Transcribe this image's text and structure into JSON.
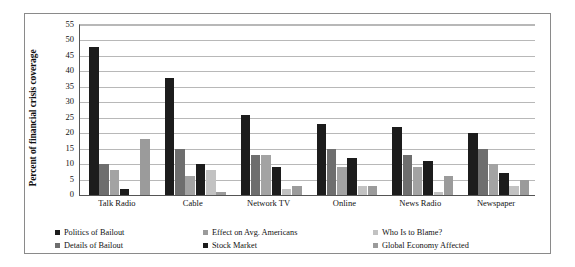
{
  "chart_data": {
    "type": "bar",
    "title": "",
    "xlabel": "",
    "ylabel": "Percent of financial crisis coverage",
    "ylim": [
      0,
      55
    ],
    "ytick_step": 5,
    "yticks": [
      0,
      5,
      10,
      15,
      20,
      25,
      30,
      35,
      40,
      45,
      50,
      55
    ],
    "grid": true,
    "legend_position": "bottom-left",
    "categories": [
      "Talk Radio",
      "Cable",
      "Network TV",
      "Online",
      "News Radio",
      "Newspaper"
    ],
    "series": [
      {
        "name": "Politics of Bailout",
        "color": "#1c1c1c",
        "values": [
          48,
          38,
          26,
          23,
          22,
          20
        ]
      },
      {
        "name": "Details of Bailout",
        "color": "#6e6e6e",
        "values": [
          10,
          15,
          13,
          15,
          13,
          15
        ]
      },
      {
        "name": "Effect on Avg. Americans",
        "color": "#a3a3a3",
        "values": [
          8,
          6,
          13,
          9,
          9,
          10
        ]
      },
      {
        "name": "Stock Market",
        "color": "#1c1c1c",
        "values": [
          2,
          10,
          9,
          12,
          11,
          7
        ]
      },
      {
        "name": "Who Is to Blame?",
        "color": "#c2c2c2",
        "values": [
          0,
          8,
          2,
          3,
          1,
          3
        ]
      },
      {
        "name": "Global Economy Affected",
        "color": "#9b9b9b",
        "values": [
          18,
          1,
          3,
          3,
          6,
          5
        ]
      }
    ]
  },
  "axis": {
    "y_title": "Percent of financial crisis coverage",
    "y_tick_labels": [
      "55",
      "50",
      "45",
      "40",
      "35",
      "30",
      "25",
      "20",
      "15",
      "10",
      "5",
      "0"
    ]
  },
  "legend": {
    "items": [
      {
        "label": "Politics of Bailout",
        "color": "#1c1c1c"
      },
      {
        "label": "Effect on Avg. Americans",
        "color": "#9b9b9b"
      },
      {
        "label": "Who Is to Blame?",
        "color": "#c2c2c2"
      },
      {
        "label": "Details of Bailout",
        "color": "#6e6e6e"
      },
      {
        "label": "Stock Market",
        "color": "#1c1c1c"
      },
      {
        "label": "Global Economy Affected",
        "color": "#9b9b9b"
      }
    ]
  }
}
